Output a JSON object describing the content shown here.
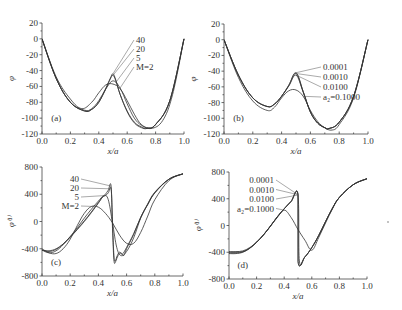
{
  "chart_data": [
    {
      "type": "line",
      "panel": "(a)",
      "xlabel": "x/a",
      "ylabel": "φ",
      "xlim": [
        0.0,
        1.0
      ],
      "ylim": [
        -120,
        20
      ],
      "xticks": [
        0.0,
        0.2,
        0.4,
        0.6,
        0.8,
        1.0
      ],
      "yticks": [
        20,
        0,
        -20,
        -40,
        -60,
        -80,
        -100,
        -120
      ],
      "grid": false,
      "box": {
        "x0": 42,
        "x1": 184,
        "yTop": 23,
        "yBottom": 134
      },
      "legend_prefix": "M=",
      "legend_anchor": {
        "x": 0.5,
        "y": -44
      },
      "series": [
        {
          "name": "40",
          "label": "40",
          "x": [
            0,
            0.1,
            0.2,
            0.3,
            0.35,
            0.4,
            0.45,
            0.48,
            0.5,
            0.52,
            0.55,
            0.6,
            0.65,
            0.7,
            0.74,
            0.8,
            0.9,
            1.0
          ],
          "y": [
            0,
            -50,
            -80,
            -91,
            -89,
            -80,
            -62,
            -50,
            -44,
            -52,
            -70,
            -92,
            -106,
            -112,
            -113,
            -108,
            -78,
            0
          ]
        },
        {
          "name": "20",
          "label": "20",
          "x": [
            0,
            0.1,
            0.2,
            0.3,
            0.35,
            0.4,
            0.45,
            0.48,
            0.5,
            0.52,
            0.55,
            0.6,
            0.65,
            0.7,
            0.74,
            0.8,
            0.9,
            1.0
          ],
          "y": [
            0,
            -50,
            -80,
            -91,
            -89,
            -80,
            -63,
            -51,
            -46,
            -53,
            -70,
            -91,
            -105,
            -111,
            -113,
            -108,
            -78,
            0
          ]
        },
        {
          "name": "5",
          "label": "5",
          "x": [
            0,
            0.1,
            0.2,
            0.3,
            0.35,
            0.4,
            0.45,
            0.5,
            0.55,
            0.6,
            0.65,
            0.7,
            0.75,
            0.8,
            0.9,
            1.0
          ],
          "y": [
            0,
            -50,
            -80,
            -90,
            -88,
            -78,
            -63,
            -53,
            -62,
            -82,
            -100,
            -109,
            -112,
            -108,
            -78,
            0
          ]
        },
        {
          "name": "M=2",
          "label": "M=2",
          "x": [
            0,
            0.1,
            0.2,
            0.28,
            0.35,
            0.4,
            0.45,
            0.5,
            0.55,
            0.6,
            0.65,
            0.7,
            0.77,
            0.85,
            0.92,
            1.0
          ],
          "y": [
            0,
            -48,
            -76,
            -88,
            -80,
            -68,
            -58,
            -57,
            -63,
            -78,
            -95,
            -108,
            -113,
            -103,
            -70,
            0
          ]
        }
      ],
      "annotations": [
        {
          "text": "(a)",
          "x": 0.1,
          "y": -104
        }
      ]
    },
    {
      "type": "line",
      "panel": "(b)",
      "xlabel": "x/a",
      "ylabel": "φ",
      "xlim": [
        0.0,
        1.0
      ],
      "ylim": [
        -120,
        20
      ],
      "xticks": [
        0.0,
        0.2,
        0.4,
        0.6,
        0.8,
        1.0
      ],
      "yticks": [
        20,
        0,
        -20,
        -40,
        -60,
        -80,
        -100,
        -120
      ],
      "grid": false,
      "box": {
        "x0": 224,
        "x1": 368,
        "yTop": 24,
        "yBottom": 134
      },
      "legend_prefix": "a₂=",
      "legend_anchor": {
        "x": 0.5,
        "y": -42
      },
      "series": [
        {
          "name": "0.0001",
          "label": "0.0001",
          "x": [
            0,
            0.1,
            0.2,
            0.3,
            0.35,
            0.4,
            0.45,
            0.5,
            0.55,
            0.6,
            0.65,
            0.7,
            0.73,
            0.8,
            0.9,
            1.0
          ],
          "y": [
            0,
            -45,
            -74,
            -85,
            -82,
            -72,
            -58,
            -42,
            -66,
            -92,
            -106,
            -112,
            -113,
            -105,
            -72,
            0
          ]
        },
        {
          "name": "0.0010",
          "label": "0.0010",
          "x": [
            0,
            0.1,
            0.2,
            0.3,
            0.35,
            0.4,
            0.45,
            0.5,
            0.55,
            0.6,
            0.65,
            0.7,
            0.73,
            0.8,
            0.9,
            1.0
          ],
          "y": [
            0,
            -45,
            -74,
            -85,
            -82,
            -72,
            -58,
            -43,
            -66,
            -92,
            -106,
            -112,
            -113,
            -105,
            -72,
            0
          ]
        },
        {
          "name": "0.0100",
          "label": "0.0100",
          "x": [
            0,
            0.1,
            0.2,
            0.3,
            0.35,
            0.4,
            0.45,
            0.5,
            0.55,
            0.6,
            0.65,
            0.7,
            0.73,
            0.8,
            0.9,
            1.0
          ],
          "y": [
            0,
            -45,
            -74,
            -85,
            -82,
            -72,
            -59,
            -45,
            -67,
            -92,
            -106,
            -112,
            -113,
            -105,
            -72,
            0
          ]
        },
        {
          "name": "a2=0.1000",
          "label": "a₂=0.1000",
          "x": [
            0,
            0.1,
            0.2,
            0.3,
            0.35,
            0.4,
            0.45,
            0.5,
            0.55,
            0.6,
            0.65,
            0.7,
            0.75,
            0.8,
            0.9,
            1.0
          ],
          "y": [
            0,
            -48,
            -78,
            -90,
            -86,
            -74,
            -65,
            -64,
            -72,
            -90,
            -104,
            -112,
            -115,
            -108,
            -74,
            0
          ]
        }
      ],
      "annotations": [
        {
          "text": "(b)",
          "x": 0.1,
          "y": -104
        }
      ]
    },
    {
      "type": "line",
      "panel": "(c)",
      "xlabel": "x/a",
      "ylabel": "φ⁽¹⁾",
      "xlim": [
        0.0,
        1.0
      ],
      "ylim": [
        -800,
        800
      ],
      "xticks": [
        0.0,
        0.2,
        0.4,
        0.6,
        0.8,
        1.0
      ],
      "yticks": [
        800,
        400,
        0,
        -400,
        -800
      ],
      "grid": false,
      "box": {
        "x0": 42,
        "x1": 183,
        "yTop": 167,
        "yBottom": 276
      },
      "legend_prefix": "M=",
      "legend_anchor": {
        "x": 0.49,
        "y": 530
      },
      "series": [
        {
          "name": "40",
          "label": "40",
          "x": [
            0,
            0.05,
            0.1,
            0.15,
            0.2,
            0.25,
            0.3,
            0.35,
            0.4,
            0.43,
            0.45,
            0.47,
            0.49,
            0.5,
            0.51,
            0.52,
            0.53,
            0.55,
            0.57,
            0.6,
            0.65,
            0.7,
            0.75,
            0.8,
            0.9,
            1.0
          ],
          "y": [
            -420,
            -430,
            -400,
            -330,
            -230,
            -120,
            0,
            130,
            270,
            360,
            400,
            460,
            520,
            -100,
            -560,
            -600,
            -520,
            -450,
            -480,
            -380,
            -180,
            60,
            250,
            420,
            620,
            700
          ]
        },
        {
          "name": "20",
          "label": "20",
          "x": [
            0,
            0.05,
            0.1,
            0.15,
            0.2,
            0.25,
            0.3,
            0.35,
            0.4,
            0.43,
            0.45,
            0.47,
            0.49,
            0.5,
            0.51,
            0.52,
            0.54,
            0.56,
            0.58,
            0.6,
            0.65,
            0.7,
            0.75,
            0.8,
            0.9,
            1.0
          ],
          "y": [
            -420,
            -440,
            -410,
            -330,
            -230,
            -110,
            10,
            140,
            280,
            360,
            380,
            420,
            480,
            0,
            -500,
            -580,
            -500,
            -460,
            -500,
            -400,
            -190,
            60,
            250,
            420,
            620,
            700
          ]
        },
        {
          "name": "5",
          "label": "5",
          "x": [
            0,
            0.05,
            0.1,
            0.15,
            0.2,
            0.25,
            0.3,
            0.35,
            0.4,
            0.44,
            0.47,
            0.5,
            0.53,
            0.56,
            0.6,
            0.65,
            0.7,
            0.75,
            0.8,
            0.9,
            1.0
          ],
          "y": [
            -420,
            -460,
            -430,
            -340,
            -220,
            -90,
            50,
            180,
            300,
            380,
            320,
            -20,
            -380,
            -500,
            -440,
            -240,
            50,
            260,
            430,
            620,
            700
          ]
        },
        {
          "name": "M=2",
          "label": "M=2",
          "x": [
            0,
            0.05,
            0.1,
            0.15,
            0.2,
            0.25,
            0.3,
            0.35,
            0.4,
            0.45,
            0.5,
            0.55,
            0.6,
            0.65,
            0.7,
            0.75,
            0.8,
            0.9,
            1.0
          ],
          "y": [
            -400,
            -460,
            -470,
            -400,
            -260,
            -60,
            120,
            220,
            210,
            120,
            -20,
            -200,
            -320,
            -320,
            -160,
            80,
            320,
            600,
            700
          ]
        }
      ],
      "annotations": [
        {
          "text": "(c)",
          "x": 0.1,
          "y": -640
        }
      ]
    },
    {
      "type": "line",
      "panel": "(d)",
      "xlabel": "x/a",
      "ylabel": "φ⁽¹⁾",
      "xlim": [
        0.0,
        1.0
      ],
      "ylim": [
        -800,
        800
      ],
      "xticks": [
        0.0,
        0.2,
        0.4,
        0.6,
        0.8,
        1.0
      ],
      "yticks": [
        800,
        400,
        0,
        -400,
        -800
      ],
      "grid": false,
      "box": {
        "x0": 229,
        "x1": 367,
        "yTop": 172,
        "yBottom": 279
      },
      "legend_prefix": "a₂=",
      "legend_anchor": {
        "x": 0.5,
        "y": 460
      },
      "series": [
        {
          "name": "0.0001",
          "label": "0.0001",
          "x": [
            0,
            0.05,
            0.1,
            0.15,
            0.2,
            0.25,
            0.3,
            0.35,
            0.4,
            0.45,
            0.5,
            0.5001,
            0.55,
            0.6,
            0.65,
            0.7,
            0.75,
            0.8,
            0.9,
            1.0
          ],
          "y": [
            -420,
            -420,
            -400,
            -340,
            -250,
            -140,
            -10,
            130,
            250,
            360,
            460,
            -540,
            -470,
            -330,
            -150,
            60,
            260,
            420,
            610,
            700
          ]
        },
        {
          "name": "0.0010",
          "label": "0.0010",
          "x": [
            0,
            0.05,
            0.1,
            0.15,
            0.2,
            0.25,
            0.3,
            0.35,
            0.4,
            0.45,
            0.5,
            0.501,
            0.55,
            0.6,
            0.65,
            0.7,
            0.75,
            0.8,
            0.9,
            1.0
          ],
          "y": [
            -410,
            -410,
            -395,
            -340,
            -250,
            -140,
            -10,
            130,
            250,
            360,
            460,
            -540,
            -470,
            -330,
            -150,
            60,
            260,
            420,
            610,
            700
          ]
        },
        {
          "name": "0.0100",
          "label": "0.0100",
          "x": [
            0,
            0.05,
            0.1,
            0.15,
            0.2,
            0.25,
            0.3,
            0.35,
            0.4,
            0.45,
            0.5,
            0.51,
            0.55,
            0.6,
            0.65,
            0.7,
            0.75,
            0.8,
            0.9,
            1.0
          ],
          "y": [
            -400,
            -400,
            -390,
            -340,
            -250,
            -140,
            -10,
            130,
            250,
            360,
            450,
            -530,
            -470,
            -330,
            -150,
            60,
            260,
            420,
            610,
            700
          ]
        },
        {
          "name": "a2=0.1000",
          "label": "a₂=0.1000",
          "x": [
            0,
            0.05,
            0.1,
            0.15,
            0.2,
            0.25,
            0.3,
            0.35,
            0.4,
            0.45,
            0.5,
            0.55,
            0.6,
            0.65,
            0.7,
            0.75,
            0.8,
            0.9,
            1.0
          ],
          "y": [
            -390,
            -390,
            -380,
            -330,
            -250,
            -140,
            -10,
            120,
            230,
            120,
            -60,
            -220,
            -370,
            -180,
            40,
            250,
            420,
            610,
            700
          ]
        }
      ],
      "annotations": [
        {
          "text": "(d)",
          "x": 0.1,
          "y": -640
        }
      ]
    }
  ]
}
